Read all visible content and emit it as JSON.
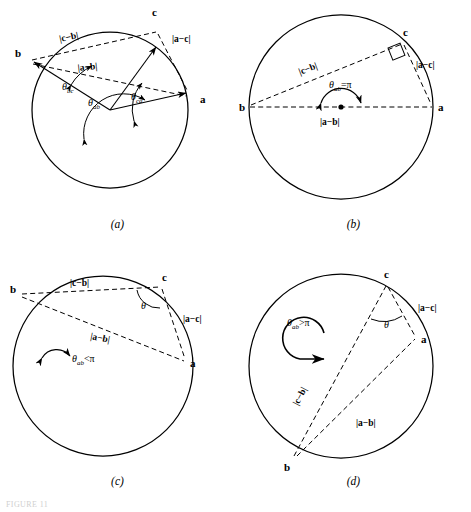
{
  "figure": {
    "type": "geometry-diagram-grid",
    "columns": 2,
    "rows": 2,
    "caption_fragment": "FIGURE 11",
    "panels": [
      {
        "id": "a",
        "caption": "(a)",
        "description": "Three unit vectors a, b, c drawn from the centre of a circle to its circumference; dashed chords join the tips and the three central angles are marked.",
        "vertices": [
          {
            "label": "a",
            "x": 196,
            "y": 99
          },
          {
            "label": "b",
            "x": 23,
            "y": 64
          },
          {
            "label": "c",
            "x": 157,
            "y": 20
          }
        ],
        "chords": [
          {
            "label": "|c−b|",
            "from": "b",
            "to": "c"
          },
          {
            "label": "|a−c|",
            "from": "c",
            "to": "a"
          },
          {
            "label": "|a−b|",
            "from": "b",
            "to": "a"
          }
        ],
        "angles": [
          {
            "base": "θ",
            "sub": "bc"
          },
          {
            "base": "θ",
            "sub": "ab"
          },
          {
            "base": "θ",
            "sub": "ca"
          }
        ]
      },
      {
        "id": "b",
        "caption": "(b)",
        "description": "a and b are diametrically opposite, so the central angle is exactly pi and the inscribed angle at c is a right angle.",
        "vertices": [
          {
            "label": "a",
            "x": 197,
            "y": 104
          },
          {
            "label": "b",
            "x": 13,
            "y": 104
          },
          {
            "label": "c",
            "x": 165,
            "y": 40
          }
        ],
        "chords": [
          {
            "label": "|c−b|",
            "from": "b",
            "to": "c"
          },
          {
            "label": "|a−c|",
            "from": "c",
            "to": "a"
          },
          {
            "label": "|a−b|",
            "from": "b",
            "to": "a"
          }
        ],
        "angle_annotation": {
          "base": "θ",
          "sub": "ab",
          "relation": "=",
          "value": "π"
        },
        "markers": [
          "right-angle-square-at-c",
          "centre-dot",
          "semicircular-double-arrow"
        ]
      },
      {
        "id": "c",
        "caption": "(c)",
        "description": "The central angle from a to b is less than pi; the inscribed angle theta at c is acute.",
        "vertices": [
          {
            "label": "a",
            "x": 186,
            "y": 105
          },
          {
            "label": "b",
            "x": 20,
            "y": 35
          },
          {
            "label": "c",
            "x": 160,
            "y": 29
          }
        ],
        "chords": [
          {
            "label": "|c−b|",
            "from": "b",
            "to": "c"
          },
          {
            "label": "|a−c|",
            "from": "c",
            "to": "a"
          },
          {
            "label": "|a−b|",
            "from": "b",
            "to": "a"
          }
        ],
        "inscribed_angle": "θ",
        "angle_annotation": {
          "base": "θ",
          "sub": "ab",
          "relation": "<",
          "value": "π"
        },
        "markers": [
          "small-arc-arrow"
        ]
      },
      {
        "id": "d",
        "caption": "(d)",
        "description": "The central angle from a to b exceeds pi (reflex); a large looping arrow indicates the sweep and theta at c is obtuse-side.",
        "vertices": [
          {
            "label": "a",
            "x": 180,
            "y": 73
          },
          {
            "label": "b",
            "x": 60,
            "y": 205
          },
          {
            "label": "c",
            "x": 151,
            "y": 24
          }
        ],
        "chords": [
          {
            "label": "|c−b|",
            "from": "b",
            "to": "c"
          },
          {
            "label": "|a−c|",
            "from": "c",
            "to": "a"
          },
          {
            "label": "|a−b|",
            "from": "b",
            "to": "a"
          }
        ],
        "inscribed_angle": "θ",
        "angle_annotation": {
          "base": "θ",
          "sub": "ab",
          "relation": ">",
          "value": "π"
        },
        "markers": [
          "large-loop-arrow"
        ]
      }
    ],
    "colors": {
      "stroke": "#000000",
      "background": "#ffffff"
    }
  }
}
